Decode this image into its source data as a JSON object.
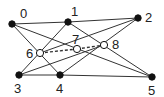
{
  "graph": {
    "nodes": [
      {
        "id": "0",
        "x": 12,
        "y": 24,
        "filled": true,
        "lx": 20,
        "ly": 7
      },
      {
        "id": "1",
        "x": 68,
        "y": 22,
        "filled": true,
        "lx": 71,
        "ly": 5
      },
      {
        "id": "2",
        "x": 138,
        "y": 18,
        "filled": true,
        "lx": 145,
        "ly": 11
      },
      {
        "id": "3",
        "x": 19,
        "y": 75,
        "filled": true,
        "lx": 14,
        "ly": 82
      },
      {
        "id": "4",
        "x": 60,
        "y": 75,
        "filled": true,
        "lx": 56,
        "ly": 82
      },
      {
        "id": "5",
        "x": 152,
        "y": 77,
        "filled": true,
        "lx": 148,
        "ly": 84
      },
      {
        "id": "6",
        "x": 40,
        "y": 53,
        "filled": false,
        "lx": 26,
        "ly": 47
      },
      {
        "id": "7",
        "x": 77,
        "y": 49,
        "filled": false,
        "lx": 72,
        "ly": 33
      },
      {
        "id": "8",
        "x": 104,
        "y": 45,
        "filled": false,
        "lx": 112,
        "ly": 38
      }
    ],
    "edges": [
      {
        "from": "0",
        "to": "1",
        "dashed": false
      },
      {
        "from": "1",
        "to": "2",
        "dashed": false
      },
      {
        "from": "0",
        "to": "4",
        "dashed": false
      },
      {
        "from": "0",
        "to": "5",
        "dashed": false
      },
      {
        "from": "1",
        "to": "3",
        "dashed": false
      },
      {
        "from": "1",
        "to": "5",
        "dashed": false
      },
      {
        "from": "2",
        "to": "6",
        "dashed": false
      },
      {
        "from": "2",
        "to": "4",
        "dashed": false
      },
      {
        "from": "3",
        "to": "8",
        "dashed": false
      },
      {
        "from": "3",
        "to": "4",
        "dashed": false
      },
      {
        "from": "4",
        "to": "5",
        "dashed": false
      },
      {
        "from": "6",
        "to": "7",
        "dashed": true
      },
      {
        "from": "7",
        "to": "8",
        "dashed": true
      }
    ],
    "colors": {
      "line": "#333333",
      "node": "#111111",
      "hollow_fill": "#ffffff"
    }
  }
}
